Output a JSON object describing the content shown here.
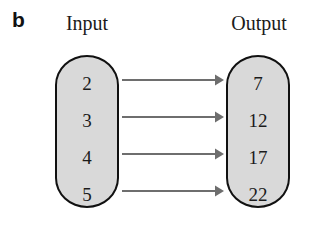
{
  "figure": {
    "panel_label": "b",
    "type": "mapping-diagram",
    "background_color": "#ffffff"
  },
  "columns": {
    "input_heading": "Input",
    "output_heading": "Output"
  },
  "colors": {
    "box_fill": "#d9d9d9",
    "box_border": "#111111",
    "arrow": "#6e6e6e",
    "text": "#1b1b1b"
  },
  "sets": {
    "input": {
      "label": "Input",
      "values": [
        "2",
        "3",
        "4",
        "5"
      ]
    },
    "output": {
      "label": "Output",
      "values": [
        "7",
        "12",
        "17",
        "22"
      ]
    }
  },
  "mappings": [
    {
      "from": "2",
      "to": "7",
      "arrow_icon": "arrow-right-icon"
    },
    {
      "from": "3",
      "to": "12",
      "arrow_icon": "arrow-right-icon"
    },
    {
      "from": "4",
      "to": "17",
      "arrow_icon": "arrow-right-icon"
    },
    {
      "from": "5",
      "to": "22",
      "arrow_icon": "arrow-right-icon"
    }
  ]
}
